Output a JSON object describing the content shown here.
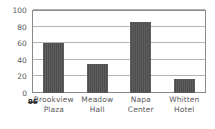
{
  "chart_data": {
    "type": "bar",
    "title": "",
    "subtitle": "",
    "xlabel": "",
    "ylabel": "",
    "categories": [
      "Brookview Plaza",
      "Meadow Hall",
      "Napa Center",
      "Whitten Hotel"
    ],
    "category_lines": [
      [
        "Brookview",
        "Plaza"
      ],
      [
        "Meadow",
        "Hall"
      ],
      [
        "Napa",
        "Center"
      ],
      [
        "Whitten",
        "Hotel"
      ]
    ],
    "values": [
      60,
      35,
      85,
      17
    ],
    "ylim": [
      0,
      100
    ],
    "yticks": [
      0,
      20,
      40,
      60,
      80,
      100
    ],
    "ytick_labels": [
      "0",
      "20",
      "40",
      "60",
      "80",
      "100"
    ],
    "grid": true,
    "legend": false,
    "legend_position": "none",
    "bar_color": "#4d4d4d",
    "grid_color": "#b4b4b4",
    "axis_color": "#8a8a8a",
    "text_color": "#5a5a5a"
  },
  "annotations": {
    "origin_mark": "96"
  }
}
